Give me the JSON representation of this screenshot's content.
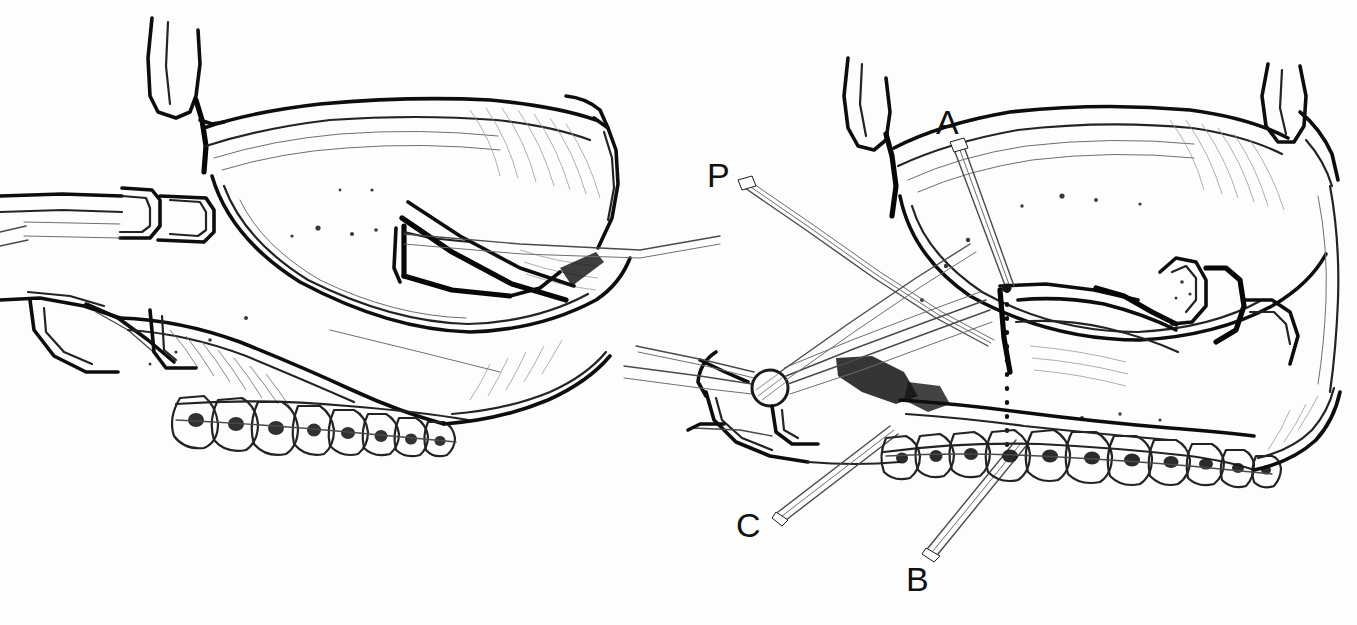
{
  "figure": {
    "background_color": "#fdfdfc",
    "ink_color": "#141414",
    "width": 1357,
    "height": 625,
    "style": "pen-and-ink medical line drawing, two panels"
  },
  "panels": [
    {
      "id": "left-panel",
      "name": "left-illustration",
      "caption": "",
      "description": "Lateral view of maxilla with retractors elevating the lip and periosteum, down-fractured maxilla and orthodontically banded dentition",
      "region": {
        "x": 0,
        "y": 20,
        "width": 620,
        "height": 470
      }
    },
    {
      "id": "right-panel",
      "name": "right-illustration",
      "caption": "",
      "description": "Same field after osteotomy showing reference marks A, B, C and posterior retractor P with dotted vertical reference line",
      "region": {
        "x": 620,
        "y": 20,
        "width": 737,
        "height": 600
      }
    }
  ],
  "labels": [
    {
      "id": "label-p",
      "text": "P",
      "x": 707,
      "y": 158,
      "leader_to_x": 1000,
      "leader_to_y": 232,
      "panel": "right-illustration"
    },
    {
      "id": "label-a",
      "text": "A",
      "x": 936,
      "y": 105,
      "leader_to_x": 1006,
      "leader_to_y": 288,
      "panel": "right-illustration"
    },
    {
      "id": "label-c",
      "text": "C",
      "x": 736,
      "y": 508,
      "leader_to_x": 878,
      "leader_to_y": 428,
      "panel": "right-illustration"
    },
    {
      "id": "label-b",
      "text": "B",
      "x": 906,
      "y": 562,
      "leader_to_x": 1012,
      "leader_to_y": 438,
      "panel": "right-illustration"
    }
  ],
  "annotations": {
    "dotted_reference_line": {
      "name": "osteotomy-reference-line",
      "style": "vertical dotted line",
      "from_x": 1007,
      "from_y": 286,
      "to_x": 1007,
      "to_y": 456
    },
    "circle_marker": {
      "name": "instrument-hub-circle",
      "cx": 770,
      "cy": 388,
      "r": 18
    }
  },
  "dentition": {
    "left_panel_teeth_count": 8,
    "right_panel_teeth_count": 11,
    "appliance": "orthodontic brackets with continuous archwire"
  },
  "instruments": {
    "left_panel": [
      "lip-retractor",
      "periosteal-elevator",
      "bone-hook"
    ],
    "right_panel": [
      "posterior-retractor-P",
      "osteotome",
      "reference-pin-A",
      "reference-pin-B",
      "reference-pin-C"
    ]
  }
}
